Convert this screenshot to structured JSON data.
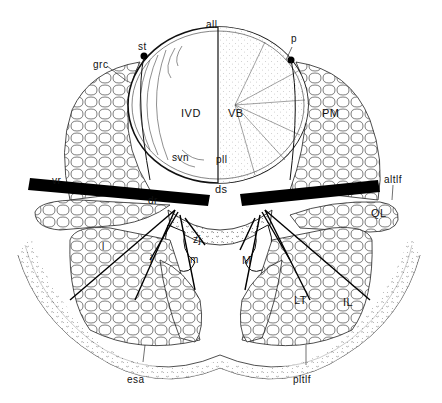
{
  "figure": {
    "type": "anatomical cross-section diagram",
    "colors": {
      "ink": "#111111",
      "background": "#ffffff",
      "nerve_fill": "#000000"
    }
  },
  "labels": {
    "all": "all",
    "st": "st",
    "p": "p",
    "grc": "grc",
    "IVD": "IVD",
    "VB": "VB",
    "PM": "PM",
    "svn": "svn",
    "pll": "pll",
    "vr": "vr",
    "ds": "ds",
    "altlf": "altlf",
    "dr": "dr",
    "QL": "QL",
    "zj": "zj",
    "l": "l",
    "i": "i",
    "m": "m",
    "M": "M",
    "LT": "LT",
    "IL": "IL",
    "esa": "esa",
    "pltlf": "pltlf"
  }
}
